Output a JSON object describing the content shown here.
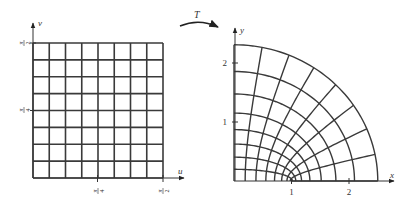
{
  "figure": {
    "colors": {
      "line": "#3a3a3a",
      "axis": "#333333",
      "background": "#ffffff"
    },
    "transform": {
      "label": "T",
      "description": "T(u,v) = (cosh u cos v, sinh u sin v)"
    },
    "left_panel": {
      "x_axis_label": "u",
      "y_axis_label": "v",
      "u_range": [
        0,
        1.5707963
      ],
      "v_range": [
        0,
        1.5707963
      ],
      "divisions": 8,
      "x_ticks": [
        {
          "value": 0.7853982,
          "label_num": "π",
          "label_den": "4"
        },
        {
          "value": 1.5707963,
          "label_num": "π",
          "label_den": "2"
        }
      ],
      "y_ticks": [
        {
          "value": 0.7853982,
          "label_num": "π",
          "label_den": "4"
        },
        {
          "value": 1.5707963,
          "label_num": "π",
          "label_den": "2"
        }
      ]
    },
    "right_panel": {
      "x_axis_label": "x",
      "y_axis_label": "y",
      "x_ticks": [
        {
          "value": 1,
          "label": "1"
        },
        {
          "value": 2,
          "label": "2"
        }
      ],
      "y_ticks": [
        {
          "value": 1,
          "label": "1"
        },
        {
          "value": 2,
          "label": "2"
        }
      ],
      "curves": "ellipses u = kπ/16 (k=1..8), hyperbolas v = kπ/16 (k=0..8)"
    }
  }
}
